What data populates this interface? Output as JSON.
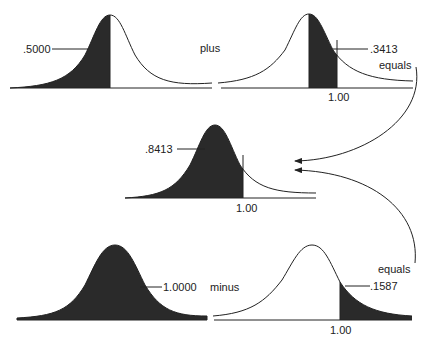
{
  "diagram": {
    "type": "normal-distribution-area-arithmetic",
    "fill_color": "#2a2a2a",
    "line_color": "#222222",
    "panels": [
      {
        "id": "top-left",
        "area_label": ".5000",
        "shaded": "left of mean"
      },
      {
        "id": "top-right",
        "area_label": ".3413",
        "axis_label": "1.00",
        "shaded": "mean to 1.00"
      },
      {
        "id": "middle",
        "area_label": ".8413",
        "axis_label": "1.00",
        "shaded": "left of 1.00"
      },
      {
        "id": "bottom-left",
        "area_label": "1.0000",
        "shaded": "entire curve"
      },
      {
        "id": "bottom-right",
        "area_label": ".1587",
        "axis_label": "1.00",
        "shaded": "right of 1.00"
      }
    ],
    "operators": {
      "plus": "plus",
      "equals_top": "equals",
      "minus": "minus",
      "equals_bottom": "equals"
    }
  }
}
